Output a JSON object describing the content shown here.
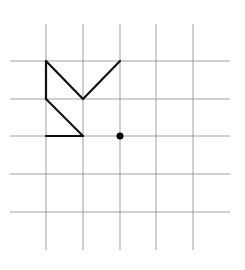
{
  "diagram": {
    "type": "grid-figure",
    "grid": {
      "columns_lines": 5,
      "row_lines": 5,
      "line_color": "#888888"
    },
    "figure": {
      "stroke_color": "#111111",
      "segments": [
        {
          "from": [
            0,
            0
          ],
          "to": [
            0,
            1
          ]
        },
        {
          "from": [
            0,
            1
          ],
          "to": [
            1,
            2
          ]
        },
        {
          "from": [
            1,
            2
          ],
          "to": [
            0,
            2
          ]
        },
        {
          "from": [
            0,
            0
          ],
          "to": [
            1,
            1
          ]
        },
        {
          "from": [
            1,
            1
          ],
          "to": [
            2,
            0
          ]
        }
      ]
    },
    "point": {
      "at": [
        2,
        2
      ],
      "color": "#000000"
    }
  }
}
